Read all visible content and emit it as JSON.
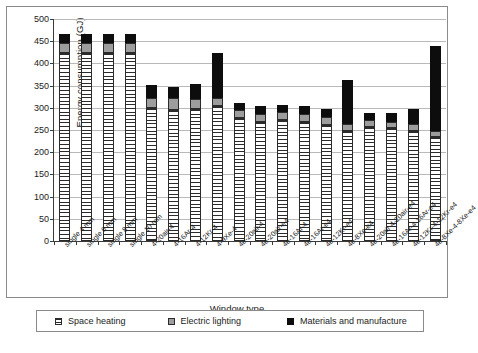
{
  "chart_data": {
    "type": "bar",
    "stacked": true,
    "title": "",
    "xlabel": "Window type",
    "ylabel": "Energy consumption (GJ)",
    "ylim": [
      0,
      500
    ],
    "yticks": [
      0,
      50,
      100,
      150,
      200,
      250,
      300,
      350,
      400,
      450,
      500
    ],
    "grid": true,
    "legend_position": "bottom",
    "categories": [
      "single 4 mm",
      "single 6 mm",
      "single 8 mm",
      "single 10 mm",
      "4-20air-4",
      "4-16Ar-4",
      "4-12Kr-4",
      "4-9Xe-4",
      "4e-20air-4",
      "4e-20air-e4",
      "4e-16Ar-4",
      "4e-16Ar-e4",
      "4e-12Kr-e4",
      "4e-8Xe-e4",
      "4e-20air-4-20air-e4",
      "4e-16Ar-4-16Ar-e4",
      "4e-12Kr-4-12Kr-e4",
      "4e-8Xe-4-8Xe-e4"
    ],
    "series": [
      {
        "name": "Space heating",
        "color": "#ffffff",
        "pattern": "horizontal-hatch",
        "values": [
          424,
          424,
          424,
          424,
          299,
          296,
          297,
          304,
          277,
          268,
          272,
          268,
          262,
          248,
          257,
          254,
          248,
          234
        ]
      },
      {
        "name": "Electric lighting",
        "color": "#9d9d9d",
        "pattern": "solid",
        "values": [
          21,
          21,
          21,
          21,
          24,
          25,
          23,
          18,
          19,
          19,
          18,
          19,
          18,
          16,
          15,
          15,
          16,
          14
        ]
      },
      {
        "name": "Materials and manufacture",
        "color": "#0d0d0d",
        "pattern": "solid",
        "values": [
          21,
          21,
          21,
          21,
          29,
          27,
          33,
          101,
          16,
          18,
          16,
          17,
          18,
          98,
          17,
          19,
          34,
          192
        ]
      }
    ],
    "totals": [
      466,
      466,
      466,
      466,
      352,
      348,
      353,
      423,
      312,
      305,
      306,
      304,
      298,
      362,
      289,
      288,
      298,
      440
    ]
  },
  "axis": {
    "y_title": "Energy consumption (GJ)",
    "x_title": "Window type"
  },
  "legend": {
    "items": [
      {
        "label": "Space heating",
        "swatch": "hatch-swatch"
      },
      {
        "label": "Electric lighting",
        "swatch": "gray-swatch"
      },
      {
        "label": "Materials and manufacture",
        "swatch": "black-swatch"
      }
    ]
  }
}
